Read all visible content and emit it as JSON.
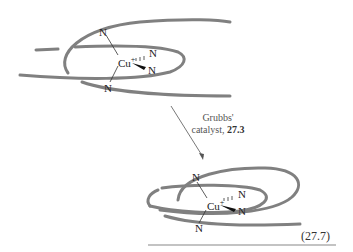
{
  "reaction": {
    "arrow_label_line1": "Grubbs'",
    "arrow_label_line2_prefix": "catalyst, ",
    "arrow_label_line2_bold": "27.3",
    "equation_number": "(27.7)"
  },
  "reactant": {
    "metal": "Cu",
    "charge": "+",
    "donor_atoms": [
      "N",
      "N",
      "N",
      "N"
    ]
  },
  "product": {
    "metal": "Cu",
    "charge": "+",
    "donor_atoms": [
      "N",
      "N",
      "N",
      "N"
    ]
  },
  "colors": {
    "strand": "#808080",
    "text": "#222222",
    "rule": "#888888"
  }
}
